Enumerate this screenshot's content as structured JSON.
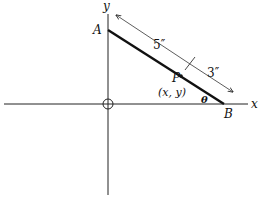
{
  "diagram": {
    "type": "geometry-ladder",
    "axes": {
      "x_label": "x",
      "y_label": "y"
    },
    "points": {
      "A": {
        "label": "A"
      },
      "B": {
        "label": "B"
      },
      "P": {
        "label": "P",
        "coords_label": "(x, y)"
      }
    },
    "angle": {
      "label": "θ"
    },
    "segments": [
      {
        "name": "AP",
        "length_label": "5″"
      },
      {
        "name": "PB",
        "length_label": "3″"
      }
    ],
    "colors": {
      "ink": "#111111",
      "background": "#ffffff"
    }
  }
}
